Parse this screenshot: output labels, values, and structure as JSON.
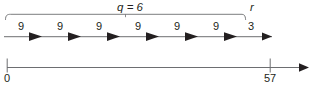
{
  "figure": {
    "type": "number-line-division-diagram",
    "colors": {
      "ink": "#231f20",
      "line": "#6d6e71",
      "background": "#ffffff"
    },
    "quotient_label": "q = 6",
    "remainder_label": "r",
    "jumps": [
      {
        "label": "9",
        "value": 9
      },
      {
        "label": "9",
        "value": 9
      },
      {
        "label": "9",
        "value": 9
      },
      {
        "label": "9",
        "value": 9
      },
      {
        "label": "9",
        "value": 9
      },
      {
        "label": "9",
        "value": 9
      },
      {
        "label": "3",
        "value": 3
      }
    ],
    "axis": {
      "start_tick_label": "0",
      "end_tick_label": "57",
      "start_value": 0,
      "end_value": 57
    }
  }
}
